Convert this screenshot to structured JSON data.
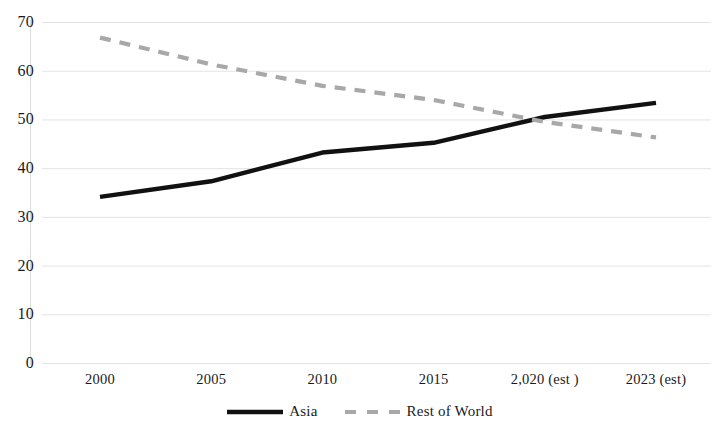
{
  "chart_data": {
    "type": "line",
    "title": "",
    "subtitle": "",
    "xlabel": "",
    "ylabel": "",
    "categories": [
      "2000",
      "2005",
      "2010",
      "2015",
      "2,020 (est )",
      "2023 (est)"
    ],
    "x_tick_labels": [
      "2000",
      "2005",
      "2010",
      "2015",
      "2,020 (est )",
      "2023 (est)"
    ],
    "y_tick_labels": [
      "0",
      "10",
      "20",
      "30",
      "40",
      "50",
      "60",
      "70"
    ],
    "y_ticks": [
      0,
      10,
      20,
      30,
      40,
      50,
      60,
      70
    ],
    "ylim": [
      0,
      70
    ],
    "grid": "horizontal",
    "legend_position": "bottom",
    "series": [
      {
        "name": "Asia",
        "color": "#111111",
        "style": "solid",
        "values": [
          34.1,
          37.3,
          43.2,
          45.2,
          50.5,
          53.4
        ]
      },
      {
        "name": "Rest of World",
        "color": "#a8a8a8",
        "style": "dashed",
        "values": [
          66.8,
          61.3,
          56.9,
          54.0,
          49.5,
          46.3
        ]
      }
    ]
  },
  "legend": {
    "items": [
      {
        "label": "Asia",
        "color": "#111111",
        "style": "solid"
      },
      {
        "label": "Rest of World",
        "color": "#a8a8a8",
        "style": "dashed"
      }
    ]
  },
  "colors": {
    "asia_line": "#111111",
    "rest_of_world_line": "#a8a8a8",
    "gridline": "#e3e3e3",
    "axis": "#d5d5d5",
    "text": "#1a1a1a",
    "background": "#ffffff"
  }
}
